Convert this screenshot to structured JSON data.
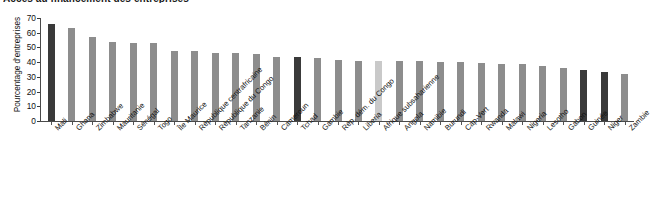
{
  "chart_data": {
    "type": "bar",
    "title": "Accès au financement des entreprises",
    "subtitle": "",
    "xlabel": "",
    "ylabel": "Pourcentage d'entreprises",
    "ylim": [
      0,
      70
    ],
    "yticks": [
      0,
      10,
      20,
      30,
      40,
      50,
      60,
      70
    ],
    "grid": false,
    "legend": "none",
    "categories": [
      "Mali",
      "Ghana",
      "Zimbabwe",
      "Mauritanie",
      "Sénégal",
      "Togo",
      "Île Maurice",
      "République centrafricaine",
      "République du Congo",
      "Tanzanie",
      "Bénin",
      "Cameroun",
      "Tchad",
      "Gambie",
      "Rép. dém. du Congo",
      "Liberia",
      "Afrique subsaharienne",
      "Angola",
      "Namibie",
      "Burundi",
      "Cap-Vert",
      "Rwanda",
      "Malawi",
      "Nigeria",
      "Lesotho",
      "Gabon",
      "Guinée",
      "Niger",
      "Zambie"
    ],
    "values": [
      66,
      63,
      57,
      53.5,
      53,
      53,
      47.5,
      47.5,
      46.5,
      46,
      45.5,
      43.5,
      43.5,
      42.5,
      41.5,
      41,
      41,
      40.5,
      40.5,
      40,
      40,
      39.5,
      39,
      38.5,
      37.5,
      36,
      34.5,
      33,
      32
    ],
    "bar_colors": [
      "#3a3a3a",
      "#8d8d8d",
      "#8d8d8d",
      "#8d8d8d",
      "#8d8d8d",
      "#8d8d8d",
      "#8d8d8d",
      "#8d8d8d",
      "#8d8d8d",
      "#8d8d8d",
      "#8d8d8d",
      "#8d8d8d",
      "#3a3a3a",
      "#8d8d8d",
      "#8d8d8d",
      "#8d8d8d",
      "#c9c9c9",
      "#8d8d8d",
      "#8d8d8d",
      "#8d8d8d",
      "#8d8d8d",
      "#8d8d8d",
      "#8d8d8d",
      "#8d8d8d",
      "#8d8d8d",
      "#8d8d8d",
      "#3a3a3a",
      "#3a3a3a",
      "#8d8d8d"
    ],
    "colors": {
      "highlight": "#3a3a3a",
      "default": "#8d8d8d",
      "average": "#c9c9c9",
      "axis": "#4a4a4a",
      "text": "#111111",
      "background": "#ffffff"
    }
  }
}
